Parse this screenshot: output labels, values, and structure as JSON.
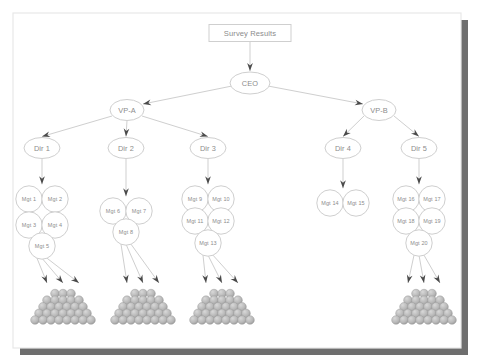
{
  "frame": {
    "border_color": "#e8e8e8",
    "shadow_color": "#6e6e6e",
    "background": "#ffffff"
  },
  "style": {
    "stroke_color": "#cfcfcf",
    "node_fill": "#ffffff",
    "text_color": "#8c8c8c",
    "arrow_color": "#4a4a4a",
    "sphere_color": "#b8b8b8",
    "sphere_highlight": "#d8d8d8",
    "sphere_shadow": "#9a9a9a"
  },
  "title_box": {
    "label": "Survey Results"
  },
  "root": {
    "label": "CEO"
  },
  "vps": [
    {
      "label": "VP-A"
    },
    {
      "label": "VP-B"
    }
  ],
  "directors": [
    {
      "label": "Dir 1",
      "managers": [
        "Mgt 1",
        "Mgt 2",
        "Mgt 3",
        "Mgt 4",
        "Mgt 5"
      ],
      "has_pyramid": true
    },
    {
      "label": "Dir 2",
      "managers": [
        "Mgt 6",
        "Mgt 7",
        "Mgt 8"
      ],
      "has_pyramid": true
    },
    {
      "label": "Dir 3",
      "managers": [
        "Mgt 9",
        "Mgt 10",
        "Mgt 11",
        "Mgt 12",
        "Mgt 13"
      ],
      "has_pyramid": true
    },
    {
      "label": "Dir 4",
      "managers": [
        "Mgt 14",
        "Mgt 15"
      ],
      "has_pyramid": false
    },
    {
      "label": "Dir 5",
      "managers": [
        "Mgt 16",
        "Mgt 17",
        "Mgt 18",
        "Mgt 19",
        "Mgt 20"
      ],
      "has_pyramid": true
    }
  ],
  "pyramids": [
    {
      "rows": [
        3,
        5,
        6,
        7,
        8
      ],
      "arrows": 3
    },
    {
      "rows": [
        3,
        5,
        6,
        7,
        8
      ],
      "arrows": 3
    },
    {
      "rows": [
        3,
        5,
        6,
        7,
        8
      ],
      "arrows": 3
    },
    {
      "rows": [
        3,
        5,
        6,
        7,
        8
      ],
      "arrows": 3
    }
  ]
}
